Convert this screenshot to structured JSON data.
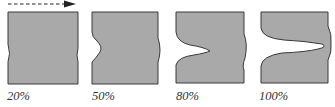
{
  "diagram": {
    "type": "deformation-stages",
    "direction_arrow": "dashed-right-arrow",
    "fill_color": "#a9a9a9",
    "stroke_color": "#3a3a3a",
    "stages": [
      {
        "label": "20%"
      },
      {
        "label": "50%"
      },
      {
        "label": "80%"
      },
      {
        "label": "100%"
      }
    ]
  }
}
